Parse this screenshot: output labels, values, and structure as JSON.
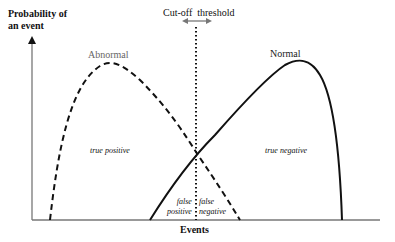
{
  "axes": {
    "y_label_line1": "Probability of",
    "y_label_line2": "an event",
    "x_label": "Events"
  },
  "threshold": {
    "label_left": "Cut-off",
    "label_right": "threshold"
  },
  "curves": {
    "abnormal": {
      "label": "Abnormal",
      "style": "dashed",
      "color": "#000000",
      "label_color": "#666666"
    },
    "normal": {
      "label": "Normal",
      "style": "solid",
      "color": "#000000",
      "label_color": "#222222"
    }
  },
  "regions": {
    "true_positive": "true positive",
    "true_negative": "true negative",
    "false_positive_1": "false",
    "false_positive_2": "positive",
    "false_negative_1": "false",
    "false_negative_2": "negative"
  }
}
